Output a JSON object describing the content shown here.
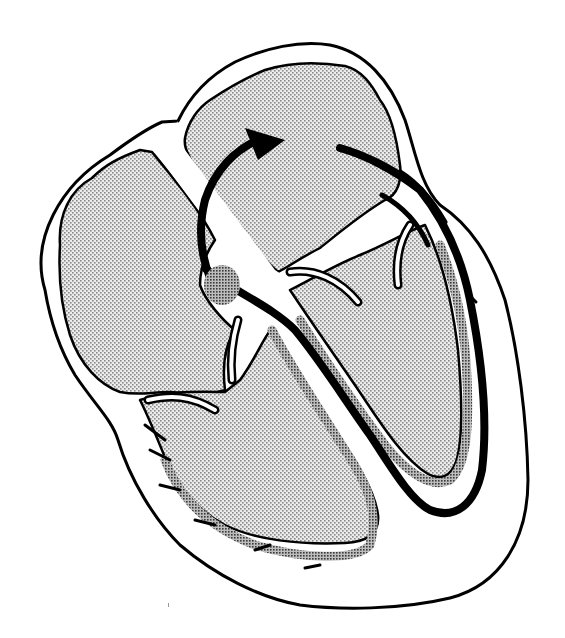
{
  "figure": {
    "title": "",
    "colors": {
      "background": "#ffffff",
      "stroke": "#000000",
      "chamber_fill": "#d9d9d9",
      "conduction_band_fill": "#9a9a9a"
    },
    "elements": [
      {
        "name": "outer-heart-outline"
      },
      {
        "name": "left-upper-chamber"
      },
      {
        "name": "right-upper-chamber"
      },
      {
        "name": "left-lower-chamber"
      },
      {
        "name": "right-lower-chamber"
      },
      {
        "name": "curved-flow-arrow"
      },
      {
        "name": "conduction-pathway"
      },
      {
        "name": "node-blob"
      }
    ],
    "labels": []
  }
}
